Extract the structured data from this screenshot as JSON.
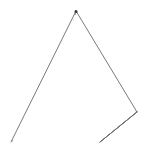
{
  "figure": {
    "shape_name": "square pyramid",
    "projection": "oblique",
    "background_color": "#ffffff",
    "visible_edge_color": "#6b6b6b",
    "hidden_edge_color": "#8a8a8a",
    "face_fill_color": "#ffffff",
    "apex_marker_color": "#3a3a3a",
    "stroke_width": 0.9,
    "hidden_dash_pattern": "4.2 3.4",
    "canvas": {
      "width": 148,
      "height": 150
    }
  },
  "chart_data": {
    "type": "diagram",
    "vertices": [
      {
        "id": "apex",
        "label": "apex",
        "x": 76,
        "y": 11,
        "hidden": false
      },
      {
        "id": "front_left",
        "label": "front-left base",
        "x": 11,
        "y": 142,
        "hidden": false
      },
      {
        "id": "front_right",
        "label": "front-right base",
        "x": 100,
        "y": 142,
        "hidden": false
      },
      {
        "id": "right",
        "label": "right base",
        "x": 137,
        "y": 112,
        "hidden": false
      },
      {
        "id": "back",
        "label": "back base (hidden)",
        "x": 52,
        "y": 112,
        "hidden": true
      }
    ],
    "edges": [
      {
        "id": "apex-front_left",
        "from": "apex",
        "to": "front_left",
        "style": "solid"
      },
      {
        "id": "apex-front_right",
        "from": "apex",
        "to": "front_right",
        "style": "solid"
      },
      {
        "id": "apex-right",
        "from": "apex",
        "to": "right",
        "style": "solid"
      },
      {
        "id": "apex-back",
        "from": "apex",
        "to": "back",
        "style": "dashed"
      },
      {
        "id": "base-front",
        "from": "front_left",
        "to": "front_right",
        "style": "solid"
      },
      {
        "id": "base-right",
        "from": "front_right",
        "to": "right",
        "style": "solid"
      },
      {
        "id": "base-back-right",
        "from": "right",
        "to": "back",
        "style": "dashed"
      },
      {
        "id": "base-back-left",
        "from": "back",
        "to": "front_left",
        "style": "dashed"
      }
    ],
    "faces": [
      {
        "id": "face-front-left",
        "vertices": [
          "apex",
          "front_left",
          "front_right"
        ],
        "visible": true
      },
      {
        "id": "face-front-right",
        "vertices": [
          "apex",
          "front_right",
          "right"
        ],
        "visible": true
      }
    ],
    "edge_count": 8,
    "vertex_count": 5,
    "face_count": 5,
    "xlabel": "",
    "ylabel": "",
    "legend": [],
    "annotations": []
  }
}
